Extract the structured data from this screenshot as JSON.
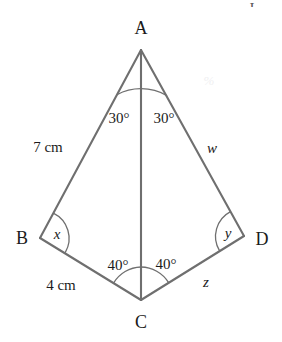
{
  "figure": {
    "line_color": "#6f6f6f",
    "label_color": "#1b1b1b",
    "background_color": "#ffffff",
    "vertices": [
      {
        "name": "A",
        "label": "A",
        "x": 141,
        "y": 50,
        "label_x": 141,
        "label_y": 28
      },
      {
        "name": "B",
        "label": "B",
        "x": 40,
        "y": 238,
        "label_x": 22,
        "label_y": 238
      },
      {
        "name": "C",
        "label": "C",
        "x": 141,
        "y": 300,
        "label_x": 141,
        "label_y": 322
      },
      {
        "name": "D",
        "label": "D",
        "x": 244,
        "y": 236,
        "label_x": 262,
        "label_y": 239
      }
    ],
    "edges": [
      {
        "name": "AB",
        "from": "A",
        "to": "B"
      },
      {
        "name": "BC",
        "from": "B",
        "to": "C"
      },
      {
        "name": "CD",
        "from": "C",
        "to": "D"
      },
      {
        "name": "DA",
        "from": "D",
        "to": "A"
      },
      {
        "name": "AC",
        "from": "A",
        "to": "C"
      }
    ],
    "angles": [
      {
        "name": "angle-BAC",
        "vertex": "A",
        "label": "30°",
        "label_x": 119,
        "label_y": 118,
        "italic": false
      },
      {
        "name": "angle-CAD",
        "vertex": "A",
        "label": "30°",
        "label_x": 164,
        "label_y": 118,
        "italic": false
      },
      {
        "name": "angle-ABC",
        "vertex": "B",
        "label": "x",
        "label_x": 57,
        "label_y": 234,
        "italic": true
      },
      {
        "name": "angle-ADC",
        "vertex": "D",
        "label": "y",
        "label_x": 228,
        "label_y": 233,
        "italic": true
      },
      {
        "name": "angle-ACB",
        "vertex": "C",
        "label": "40°",
        "label_x": 118,
        "label_y": 265,
        "italic": false
      },
      {
        "name": "angle-ACD",
        "vertex": "C",
        "label": "40°",
        "label_x": 166,
        "label_y": 264,
        "italic": false
      }
    ],
    "side_labels": [
      {
        "name": "side-AB-length",
        "edge": "AB",
        "label": "7 cm",
        "label_x": 48,
        "label_y": 147,
        "italic": false
      },
      {
        "name": "side-BC-length",
        "edge": "BC",
        "label": "4 cm",
        "label_x": 61,
        "label_y": 285,
        "italic": false
      },
      {
        "name": "side-DA-length",
        "edge": "DA",
        "label": "w",
        "label_x": 212,
        "label_y": 148,
        "italic": true
      },
      {
        "name": "side-CD-length",
        "edge": "CD",
        "label": "z",
        "label_x": 206,
        "label_y": 282,
        "italic": true
      }
    ],
    "artifacts": {
      "top_partial_glyph": "I",
      "watermark_text": "%"
    }
  }
}
